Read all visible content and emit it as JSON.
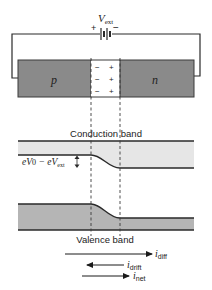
{
  "figure": {
    "circuit": {
      "voltage_label": "V",
      "voltage_subscript": "ext",
      "plus_sign": "+",
      "minus_sign": "−"
    },
    "semiconductor": {
      "p_label": "p",
      "n_label": "n",
      "depletion_charges": {
        "left_column": [
          "−",
          "−",
          "−"
        ],
        "right_column": [
          "+",
          "+",
          "+"
        ]
      }
    },
    "bands": {
      "conduction_band_label": "Conduction band",
      "valence_band_label": "Valence band",
      "barrier_label_part1": "eV",
      "barrier_label_sub1": "0",
      "barrier_label_minus": " − eV",
      "barrier_label_sub2": "ext"
    },
    "currents": [
      {
        "symbol": "i",
        "subscript": "diff",
        "direction": "right"
      },
      {
        "symbol": "i",
        "subscript": "drift",
        "direction": "left"
      },
      {
        "symbol": "i",
        "subscript": "net",
        "direction": "right"
      }
    ],
    "colors": {
      "semiconductor_fill": "#8a8a8a",
      "conduction_band_fill": "#e6e6e6",
      "valence_band_fill": "#b5b5b5",
      "line": "#2a2a2a"
    }
  }
}
